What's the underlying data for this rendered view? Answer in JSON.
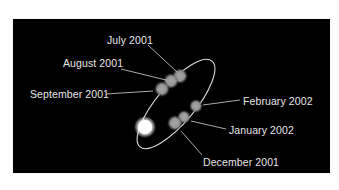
{
  "figure": {
    "background_color": "#000000",
    "orbit_color": "#d9d9d9",
    "label_color": "#e6e6e6",
    "leader_color": "#bdbdbd",
    "primary_object": {
      "name": "bright-central-body",
      "cx": 145,
      "cy": 127,
      "r": 8
    },
    "orbit": {
      "cx": 176,
      "cy": 104,
      "rx": 56,
      "ry": 19,
      "rotation": -50
    },
    "labels": [
      {
        "id": "july-2001",
        "text": "July 2001",
        "x": 107,
        "y": 34,
        "line": [
          148,
          45,
          177,
          72
        ],
        "blob": [
          180,
          76,
          6
        ]
      },
      {
        "id": "august-2001",
        "text": "August 2001",
        "x": 63,
        "y": 57,
        "line": [
          121,
          69,
          166,
          80
        ],
        "blob": [
          171,
          81,
          6
        ]
      },
      {
        "id": "september-2001",
        "text": "September 2001",
        "x": 30,
        "y": 88,
        "line": [
          106,
          94,
          153,
          91
        ],
        "blob": [
          162,
          89,
          6
        ]
      },
      {
        "id": "february-2002",
        "text": "February 2002",
        "x": 243,
        "y": 95,
        "line": [
          240,
          100,
          203,
          105
        ],
        "blob": [
          196,
          106,
          5
        ]
      },
      {
        "id": "january-2002",
        "text": "January 2002",
        "x": 229,
        "y": 124,
        "line": [
          226,
          129,
          191,
          121
        ],
        "blob": [
          184,
          117,
          5
        ]
      },
      {
        "id": "december-2001",
        "text": "December 2001",
        "x": 203,
        "y": 156,
        "line": [
          202,
          155,
          181,
          131
        ],
        "blob": [
          175,
          123,
          6
        ]
      }
    ]
  }
}
